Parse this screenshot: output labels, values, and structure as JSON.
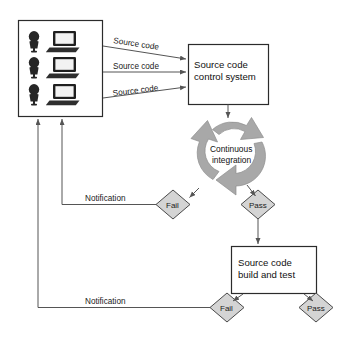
{
  "diagram": {
    "background_color": "#ffffff",
    "line_color": "#555555",
    "box_fill": "#ffffff",
    "box_stroke": "#2b2b2b",
    "diamond_fill": "#d4d4d4",
    "diamond_stroke": "#4a4a4a",
    "cycle_arrow_color": "#a8a8a8"
  },
  "developers": {
    "name": "developer-workstations",
    "count": 3,
    "icon_person": "person-icon",
    "icon_computer": "laptop-icon"
  },
  "edges": {
    "source_code_1": "Source code",
    "source_code_2": "Source code",
    "source_code_3": "Source code",
    "notification_1": "Notification",
    "notification_2": "Notification"
  },
  "nodes": {
    "scm": {
      "line1": "Source code",
      "line2": "control system"
    },
    "cycle": {
      "line1": "Continuous",
      "line2": "integration"
    },
    "build": {
      "line1": "Source code",
      "line2": "build and test"
    },
    "ci_fail": "Fail",
    "ci_pass": "Pass",
    "build_fail": "Fail",
    "build_pass": "Pass"
  }
}
